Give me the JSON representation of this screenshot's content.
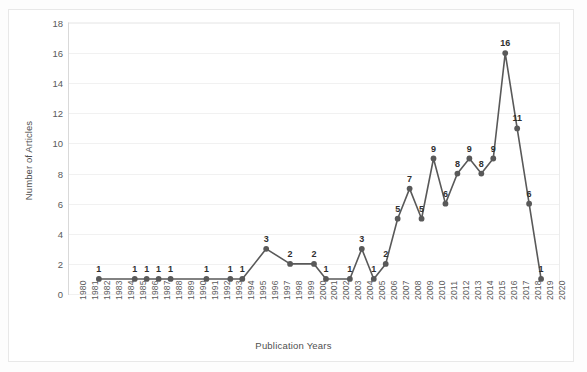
{
  "chart_data": {
    "type": "line",
    "title": "",
    "xlabel": "Publication Years",
    "ylabel": "Number of Articles",
    "categories": [
      "1980",
      "1981",
      "1982",
      "1983",
      "1984",
      "1985",
      "1986",
      "1987",
      "1988",
      "1989",
      "1990",
      "1991",
      "1992",
      "1993",
      "1994",
      "1995",
      "1996",
      "1997",
      "1998",
      "1999",
      "2000",
      "2001",
      "2002",
      "2003",
      "2004",
      "2005",
      "2006",
      "2007",
      "2008",
      "2009",
      "2010",
      "2011",
      "2012",
      "2013",
      "2014",
      "2015",
      "2016",
      "2017",
      "2018",
      "2019",
      "2020"
    ],
    "series": [
      {
        "name": "Number of Articles",
        "points": [
          {
            "x": "1982",
            "y": 1,
            "label": "1"
          },
          {
            "x": "1985",
            "y": 1,
            "label": "1"
          },
          {
            "x": "1986",
            "y": 1,
            "label": "1"
          },
          {
            "x": "1987",
            "y": 1,
            "label": "1"
          },
          {
            "x": "1988",
            "y": 1,
            "label": "1"
          },
          {
            "x": "1991",
            "y": 1,
            "label": "1"
          },
          {
            "x": "1993",
            "y": 1,
            "label": "1"
          },
          {
            "x": "1994",
            "y": 1,
            "label": "1"
          },
          {
            "x": "1996",
            "y": 3,
            "label": "3"
          },
          {
            "x": "1998",
            "y": 2,
            "label": "2"
          },
          {
            "x": "2000",
            "y": 2,
            "label": "2"
          },
          {
            "x": "2001",
            "y": 1,
            "label": "1"
          },
          {
            "x": "2003",
            "y": 1,
            "label": "1"
          },
          {
            "x": "2004",
            "y": 3,
            "label": "3"
          },
          {
            "x": "2005",
            "y": 1,
            "label": "1"
          },
          {
            "x": "2006",
            "y": 2,
            "label": "2"
          },
          {
            "x": "2007",
            "y": 5,
            "label": "5"
          },
          {
            "x": "2008",
            "y": 7,
            "label": "7"
          },
          {
            "x": "2009",
            "y": 5,
            "label": "5"
          },
          {
            "x": "2010",
            "y": 9,
            "label": "9"
          },
          {
            "x": "2011",
            "y": 6,
            "label": "6"
          },
          {
            "x": "2012",
            "y": 8,
            "label": "8"
          },
          {
            "x": "2013",
            "y": 9,
            "label": "9"
          },
          {
            "x": "2014",
            "y": 8,
            "label": "8"
          },
          {
            "x": "2015",
            "y": 9,
            "label": "9"
          },
          {
            "x": "2016",
            "y": 16,
            "label": "16"
          },
          {
            "x": "2017",
            "y": 11,
            "label": "11"
          },
          {
            "x": "2018",
            "y": 6,
            "label": "6"
          },
          {
            "x": "2019",
            "y": 1,
            "label": "1"
          }
        ]
      }
    ],
    "yticks": [
      0,
      2,
      4,
      6,
      8,
      10,
      12,
      14,
      16,
      18
    ],
    "ylim": [
      0,
      18
    ],
    "grid": true,
    "legend": "none",
    "line_color": "#595959",
    "marker_color": "#595959",
    "label_color": "#2f2f2f",
    "grid_color": "#f1f1f1",
    "axis_color": "#d9d9d9"
  }
}
